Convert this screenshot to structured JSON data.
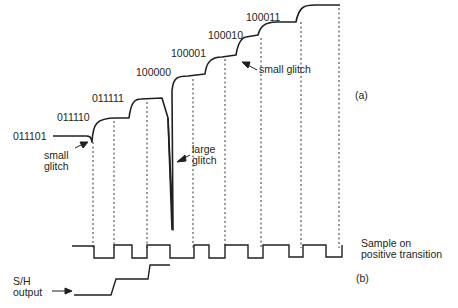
{
  "codes": [
    "011101",
    "011110",
    "011111",
    "100000",
    "100001",
    "100010",
    "100011"
  ],
  "annotations": {
    "small_glitch_left": [
      "small",
      "glitch"
    ],
    "large_glitch": [
      "large",
      "glitch"
    ],
    "small_glitch_right": "small glitch"
  },
  "panel_labels": {
    "a": "(a)",
    "b": "(b)"
  },
  "clock_label": [
    "Sample on",
    "positive transition"
  ],
  "sh_label": [
    "S/H",
    "output"
  ],
  "colors": {
    "ink": "#231f20",
    "background": "#ffffff"
  }
}
